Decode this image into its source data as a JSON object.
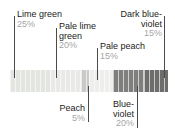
{
  "figure": {
    "bar": {
      "x": 10,
      "y": 70,
      "width": 158,
      "height": 22
    }
  },
  "chart_data": {
    "type": "bar",
    "orientation": "horizontal-stacked",
    "title": "",
    "xlabel": "",
    "ylabel": "",
    "total": "100%",
    "categories": [
      "Lime green",
      "Pale lime green",
      "Peach",
      "Pale peach",
      "Blue-violet",
      "Dark blue-violet"
    ],
    "values": [
      25,
      20,
      5,
      15,
      20,
      15
    ],
    "value_labels": [
      "25%",
      "20%",
      "5%",
      "15%",
      "20%",
      "15%"
    ],
    "colors": [
      "#e3e5e0",
      "#e9eae7",
      "#c9cac7",
      "#eeefec",
      "#7f807e",
      "#6d6e6c"
    ],
    "segments": [
      {
        "name": "Lime green",
        "percent_label": "25%",
        "percent": 25,
        "color": "#e3e5e0",
        "callout_position": "above",
        "callout_align": "left"
      },
      {
        "name": "Pale lime green",
        "percent_label": "20%",
        "percent": 20,
        "color": "#e9eae7",
        "callout_position": "above",
        "callout_align": "left"
      },
      {
        "name": "Peach",
        "percent_label": "5%",
        "percent": 5,
        "color": "#c9cac7",
        "callout_position": "below",
        "callout_align": "right"
      },
      {
        "name": "Pale peach",
        "percent_label": "15%",
        "percent": 15,
        "color": "#eeefec",
        "callout_position": "above",
        "callout_align": "left"
      },
      {
        "name": "Blue-violet",
        "percent_label": "20%",
        "percent": 20,
        "color": "#7f807e",
        "callout_position": "below",
        "callout_align": "right"
      },
      {
        "name": "Dark blue-violet",
        "percent_label": "15%",
        "percent": 15,
        "color": "#6d6e6c",
        "callout_position": "above",
        "callout_align": "right"
      }
    ]
  },
  "callouts": {
    "lime_green": {
      "name": "Lime green",
      "percent": "25%"
    },
    "pale_lime_green": {
      "name_line1": "Pale lime",
      "name_line2": "green",
      "percent": "20%"
    },
    "pale_peach": {
      "name": "Pale peach",
      "percent": "15%"
    },
    "dark_blue_violet": {
      "name_line1": "Dark blue-",
      "name_line2": "violet",
      "percent": "15%"
    },
    "peach": {
      "name": "Peach",
      "percent": "5%"
    },
    "blue_violet": {
      "name_line1": "Blue-",
      "name_line2": "violet",
      "percent": "20%"
    }
  }
}
